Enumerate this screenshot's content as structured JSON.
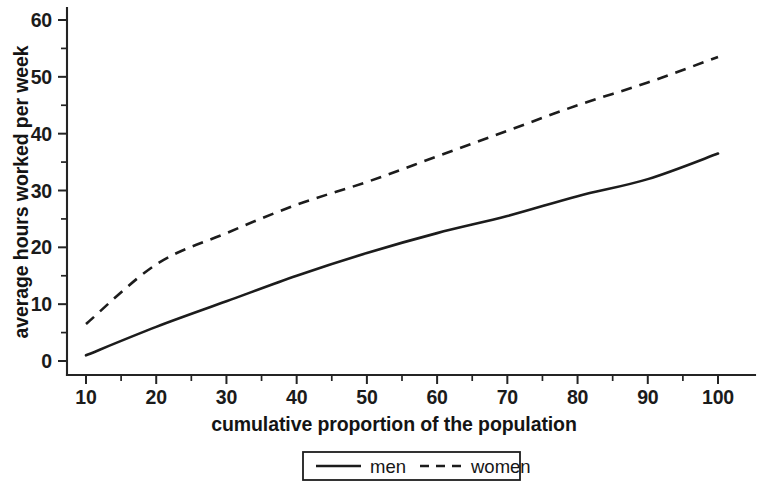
{
  "chart_data": {
    "type": "line",
    "title": "",
    "xlabel": "cumulative proportion of the population",
    "ylabel": "average hours worked per week",
    "xlim": [
      10,
      100
    ],
    "ylim": [
      0,
      60
    ],
    "grid": false,
    "legend_position": "bottom-center",
    "x": [
      10,
      20,
      30,
      40,
      50,
      60,
      70,
      80,
      90,
      100
    ],
    "xticks": [
      10,
      20,
      30,
      40,
      50,
      60,
      70,
      80,
      90,
      100
    ],
    "xtick_labels": [
      "10",
      "20",
      "30",
      "40",
      "50",
      "60",
      "70",
      "80",
      "90",
      "100"
    ],
    "xticks_minor": [
      15,
      25,
      35,
      45,
      55,
      65,
      75,
      85,
      95
    ],
    "yticks": [
      0,
      10,
      20,
      30,
      40,
      50,
      60
    ],
    "ytick_labels": [
      "0",
      "10",
      "20",
      "30",
      "40",
      "50",
      "60"
    ],
    "yticks_minor": [
      5,
      15,
      25,
      35,
      45,
      55
    ],
    "series": [
      {
        "name": "men",
        "style": "solid",
        "color": "#1c1c1c",
        "values": [
          1,
          6,
          10.5,
          15,
          19,
          22.5,
          25.5,
          29,
          32,
          36.5
        ]
      },
      {
        "name": "women",
        "style": "dashed",
        "color": "#1c1c1c",
        "values": [
          6.5,
          17,
          22.5,
          27.5,
          31.5,
          36,
          40.5,
          45,
          49,
          53.5
        ]
      }
    ]
  },
  "legend": {
    "entries": [
      {
        "label": "men",
        "style": "solid"
      },
      {
        "label": "women",
        "style": "dashed"
      }
    ]
  }
}
